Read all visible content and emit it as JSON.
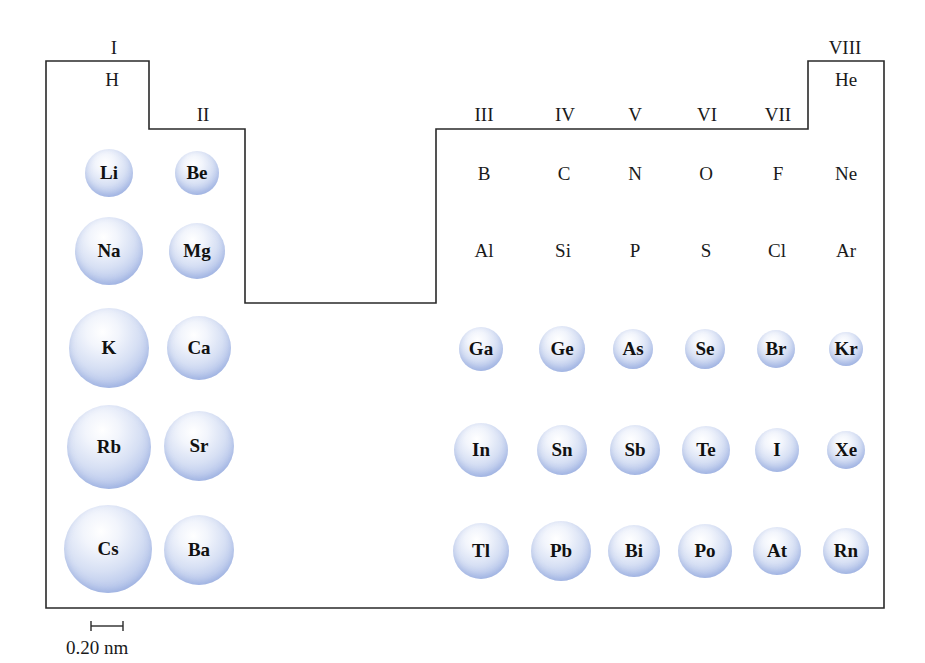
{
  "figure": {
    "outline_color": "#2a2a2a",
    "sphere_color": "#b3c3ea",
    "groups": [
      {
        "label": "I",
        "x": 114,
        "y": 47
      },
      {
        "label": "II",
        "x": 203,
        "y": 114
      },
      {
        "label": "III",
        "x": 484,
        "y": 114
      },
      {
        "label": "IV",
        "x": 565,
        "y": 114
      },
      {
        "label": "V",
        "x": 635,
        "y": 114
      },
      {
        "label": "VI",
        "x": 707,
        "y": 114
      },
      {
        "label": "VII",
        "x": 778,
        "y": 114
      },
      {
        "label": "VIII",
        "x": 845,
        "y": 47
      }
    ],
    "plain_symbols": [
      {
        "symbol": "H",
        "x": 112,
        "y": 79
      },
      {
        "symbol": "He",
        "x": 846,
        "y": 79
      },
      {
        "symbol": "B",
        "x": 484,
        "y": 173
      },
      {
        "symbol": "C",
        "x": 564,
        "y": 173
      },
      {
        "symbol": "N",
        "x": 635,
        "y": 173
      },
      {
        "symbol": "O",
        "x": 706,
        "y": 173
      },
      {
        "symbol": "F",
        "x": 778,
        "y": 173
      },
      {
        "symbol": "Ne",
        "x": 846,
        "y": 173
      },
      {
        "symbol": "Al",
        "x": 484,
        "y": 250
      },
      {
        "symbol": "Si",
        "x": 563,
        "y": 250
      },
      {
        "symbol": "P",
        "x": 635,
        "y": 250
      },
      {
        "symbol": "S",
        "x": 706,
        "y": 250
      },
      {
        "symbol": "Cl",
        "x": 777,
        "y": 250
      },
      {
        "symbol": "Ar",
        "x": 846,
        "y": 250
      }
    ],
    "atoms": [
      {
        "symbol": "Li",
        "x": 109,
        "y": 173,
        "d": 48
      },
      {
        "symbol": "Be",
        "x": 197,
        "y": 173,
        "d": 44
      },
      {
        "symbol": "Na",
        "x": 109,
        "y": 251,
        "d": 68
      },
      {
        "symbol": "Mg",
        "x": 197,
        "y": 251,
        "d": 56
      },
      {
        "symbol": "K",
        "x": 109,
        "y": 348,
        "d": 80
      },
      {
        "symbol": "Ca",
        "x": 199,
        "y": 348,
        "d": 64
      },
      {
        "symbol": "Rb",
        "x": 109,
        "y": 447,
        "d": 84
      },
      {
        "symbol": "Sr",
        "x": 199,
        "y": 446,
        "d": 70
      },
      {
        "symbol": "Cs",
        "x": 108,
        "y": 549,
        "d": 88
      },
      {
        "symbol": "Ba",
        "x": 199,
        "y": 550,
        "d": 70
      },
      {
        "symbol": "Ga",
        "x": 481,
        "y": 349,
        "d": 44
      },
      {
        "symbol": "Ge",
        "x": 562,
        "y": 349,
        "d": 46
      },
      {
        "symbol": "As",
        "x": 633,
        "y": 349,
        "d": 40
      },
      {
        "symbol": "Se",
        "x": 705,
        "y": 349,
        "d": 40
      },
      {
        "symbol": "Br",
        "x": 776,
        "y": 349,
        "d": 38
      },
      {
        "symbol": "Kr",
        "x": 846,
        "y": 349,
        "d": 34
      },
      {
        "symbol": "In",
        "x": 481,
        "y": 450,
        "d": 54
      },
      {
        "symbol": "Sn",
        "x": 562,
        "y": 450,
        "d": 50
      },
      {
        "symbol": "Sb",
        "x": 635,
        "y": 450,
        "d": 50
      },
      {
        "symbol": "Te",
        "x": 706,
        "y": 450,
        "d": 48
      },
      {
        "symbol": "I",
        "x": 777,
        "y": 450,
        "d": 44
      },
      {
        "symbol": "Xe",
        "x": 846,
        "y": 450,
        "d": 38
      },
      {
        "symbol": "Tl",
        "x": 481,
        "y": 551,
        "d": 56
      },
      {
        "symbol": "Pb",
        "x": 561,
        "y": 551,
        "d": 60
      },
      {
        "symbol": "Bi",
        "x": 634,
        "y": 551,
        "d": 52
      },
      {
        "symbol": "Po",
        "x": 705,
        "y": 551,
        "d": 54
      },
      {
        "symbol": "At",
        "x": 777,
        "y": 551,
        "d": 48
      },
      {
        "symbol": "Rn",
        "x": 846,
        "y": 551,
        "d": 46
      }
    ],
    "scale": {
      "label": "0.20 nm"
    }
  }
}
